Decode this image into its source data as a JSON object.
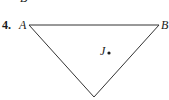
{
  "problem": {
    "number": "4.",
    "clipped_top_label": "B"
  },
  "figure": {
    "type": "triangle",
    "vertices": [
      {
        "label": "A",
        "x": 29,
        "y": 25
      },
      {
        "label": "B",
        "x": 159,
        "y": 25
      },
      {
        "label": "",
        "x": 94,
        "y": 97
      }
    ],
    "interior_point": {
      "label": "J",
      "x": 109,
      "y": 53
    },
    "stroke_color": "#333333"
  }
}
